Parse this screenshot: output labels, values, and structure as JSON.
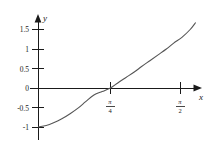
{
  "chart_data": {
    "type": "line",
    "title": "",
    "subtitle": "",
    "xlabel": "x",
    "ylabel": "y",
    "grid": false,
    "legend": null,
    "xlim": [
      0,
      1.75
    ],
    "ylim": [
      -1.15,
      1.8
    ],
    "x_ticks": [
      {
        "value": 0.7854,
        "label_numerator": "π",
        "label_denominator": "4",
        "label_text": "π/4"
      },
      {
        "value": 1.5708,
        "label_numerator": "π",
        "label_denominator": "2",
        "label_text": "π/2"
      }
    ],
    "y_ticks": [
      {
        "value": 1.5,
        "label": "1.5"
      },
      {
        "value": 1.0,
        "label": "1"
      },
      {
        "value": 0.5,
        "label": "0.5"
      },
      {
        "value": 0.0,
        "label": "0"
      },
      {
        "value": -0.5,
        "label": "-0.5"
      },
      {
        "value": -1.0,
        "label": "-1"
      }
    ],
    "axes": {
      "x_axis_arrow": true,
      "y_axis_arrow": true,
      "x_axis_at_y": 0,
      "y_axis_at_x": 0
    },
    "series": [
      {
        "name": "curve",
        "color": "#555555",
        "x": [
          0.0,
          0.09,
          0.17,
          0.26,
          0.35,
          0.44,
          0.52,
          0.61,
          0.7,
          0.79,
          0.87,
          0.96,
          1.05,
          1.13,
          1.22,
          1.31,
          1.4,
          1.48,
          1.57,
          1.66,
          1.72
        ],
        "y": [
          -1.0,
          -0.96,
          -0.89,
          -0.79,
          -0.66,
          -0.51,
          -0.35,
          -0.18,
          -0.09,
          0.0,
          0.13,
          0.27,
          0.41,
          0.55,
          0.7,
          0.85,
          1.0,
          1.15,
          1.3,
          1.5,
          1.68
        ]
      }
    ]
  },
  "labels": {
    "y_axis_name": "y",
    "x_axis_name": "x"
  }
}
